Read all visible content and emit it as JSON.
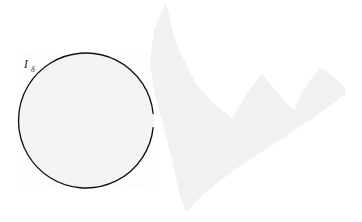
{
  "figure": {
    "background_color": "#ffffff",
    "canvas": {
      "width": 362,
      "height": 222
    },
    "labels": [
      {
        "id": "interval-delta",
        "base": "I",
        "subscript": "δ",
        "full_text": "Iδ",
        "x": 24,
        "y": 68,
        "color": "#1a1a1a"
      }
    ],
    "shapes": {
      "circle": {
        "name": "circle-I-delta",
        "center_x": 86,
        "center_y": 120.5,
        "radius": 67.5,
        "stroke_color": "#111111",
        "stroke_width": 1.35,
        "fill_color": "#f5f5f5",
        "gap": {
          "present": true,
          "start_angle_deg": -6,
          "end_angle_deg": 6,
          "description": "small opening on the right side of the circle"
        }
      },
      "region": {
        "name": "grey-jagged-region",
        "fill_color": "#f3f3f3",
        "stroke": "none",
        "vertices": [
          [
            166,
            2
          ],
          [
            176,
            44
          ],
          [
            196,
            84
          ],
          [
            214,
            104
          ],
          [
            232,
            118
          ],
          [
            243,
            100
          ],
          [
            252,
            86
          ],
          [
            262,
            74
          ],
          [
            272,
            86
          ],
          [
            284,
            100
          ],
          [
            294,
            110
          ],
          [
            300,
            96
          ],
          [
            310,
            80
          ],
          [
            320,
            68
          ],
          [
            333,
            76
          ],
          [
            345,
            88
          ],
          [
            346,
            94
          ],
          [
            316,
            116
          ],
          [
            280,
            140
          ],
          [
            240,
            166
          ],
          [
            208,
            190
          ],
          [
            186,
            212
          ],
          [
            180,
            196
          ],
          [
            172,
            160
          ],
          [
            163,
            124
          ],
          [
            155,
            96
          ],
          [
            150,
            62
          ],
          [
            154,
            30
          ]
        ]
      }
    },
    "colors": {
      "ink": "#111111",
      "paper": "#ffffff",
      "light_fill": "#f4f4f4",
      "region_fill": "#f3f3f3"
    }
  }
}
